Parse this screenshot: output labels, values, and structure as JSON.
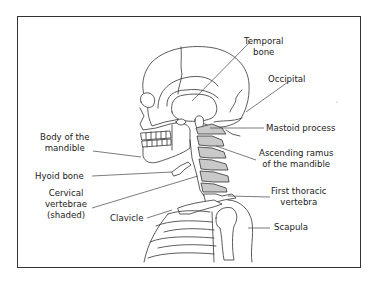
{
  "diagram": {
    "colors": {
      "outline": "#333333",
      "shaded_vertebrae": "#c9c9c9",
      "background": "#ffffff"
    },
    "labels": {
      "temporal_bone": [
        "Temporal",
        "bone"
      ],
      "occipital": [
        "Occipital"
      ],
      "mastoid_process": [
        "Mastoid process"
      ],
      "body_of_mandible": [
        "Body of the",
        "mandible"
      ],
      "ascending_ramus": [
        "Ascending ramus",
        "of the mandible"
      ],
      "hyoid_bone": [
        "Hyoid bone"
      ],
      "cervical_vertebrae": [
        "Cervical",
        "vertebrae",
        "(shaded)"
      ],
      "first_thoracic_vertebra": [
        "First thoracic",
        "vertebra"
      ],
      "clavicle": [
        "Clavicle"
      ],
      "scapula": [
        "Scapula"
      ]
    }
  }
}
